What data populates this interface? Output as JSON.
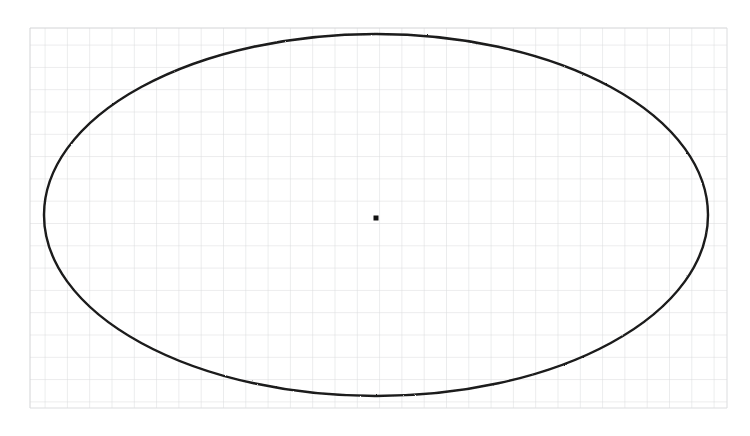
{
  "figure": {
    "kind": "geometry-figure",
    "medium": "graph-paper-scan",
    "title": "",
    "caption": "",
    "background_color": "#ffffff"
  },
  "grid": {
    "name": "graph-paper-grid",
    "visible": true,
    "line_color": "#d9dadc",
    "minor_line_color": "#e7e8ea",
    "cell_size_px": 22.3,
    "x_start_px": 30,
    "x_end_px": 727,
    "y_start_px": 28,
    "y_end_px": 408,
    "columns": 32,
    "rows": 17,
    "line_width_px": 1
  },
  "shapes": [
    {
      "id": "ellipse-main",
      "type": "ellipse",
      "label": "",
      "center_x_px": 376,
      "center_y_px": 215,
      "semi_major_axis_px": 332,
      "semi_minor_axis_px": 181,
      "left_px": 44,
      "right_px": 708,
      "top_px": 34,
      "bottom_px": 396,
      "stroke_color": "#1a1a1a",
      "stroke_width_px": 2.4,
      "fill": "none",
      "rotation_deg": 0
    },
    {
      "id": "center-point",
      "type": "point",
      "label": "",
      "x_px": 376,
      "y_px": 218,
      "size_px": 5,
      "marker": "filled-square",
      "color": "#111111"
    }
  ],
  "annotations": {
    "labels": [],
    "axes_shown": false,
    "tick_labels": []
  }
}
